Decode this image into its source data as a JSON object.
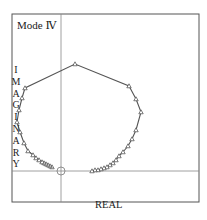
{
  "chart_data": {
    "type": "scatter",
    "xlabel": "REAL",
    "ylabel": "IMAGINARY",
    "grid": false,
    "legend": null,
    "frame_px": {
      "left": 12,
      "top": 14,
      "right": 199,
      "bottom": 202
    },
    "axes_origin_px": {
      "x": 61,
      "y": 171
    },
    "origin_marker": "circle-crosshair",
    "series": [
      {
        "name": "locus",
        "marker": "triangle",
        "line": "solid",
        "points_px": [
          [
            52,
            167
          ],
          [
            50,
            166
          ],
          [
            48,
            165
          ],
          [
            46,
            164
          ],
          [
            44,
            163
          ],
          [
            42,
            162
          ],
          [
            39,
            160
          ],
          [
            36,
            158
          ],
          [
            33,
            155
          ],
          [
            28,
            151
          ],
          [
            24,
            143
          ],
          [
            20,
            132
          ],
          [
            17,
            122
          ],
          [
            19,
            110
          ],
          [
            22,
            98
          ],
          [
            25,
            88
          ],
          [
            75,
            64
          ],
          [
            129,
            86
          ],
          [
            136,
            99
          ],
          [
            141,
            112
          ],
          [
            136,
            130
          ],
          [
            132,
            139
          ],
          [
            128,
            146
          ],
          [
            123,
            152
          ],
          [
            119,
            156
          ],
          [
            116,
            160
          ],
          [
            113,
            163
          ],
          [
            110,
            165
          ],
          [
            107,
            167
          ],
          [
            104,
            168
          ],
          [
            101,
            169
          ],
          [
            98,
            170
          ],
          [
            95,
            170
          ],
          [
            92,
            171
          ]
        ]
      }
    ]
  },
  "labels": {
    "title": "Mode Ⅳ",
    "xlabel": "REAL",
    "ylabel_letters": [
      "I",
      "M",
      "A",
      "G",
      "I",
      "N",
      "A",
      "R",
      "Y"
    ]
  }
}
